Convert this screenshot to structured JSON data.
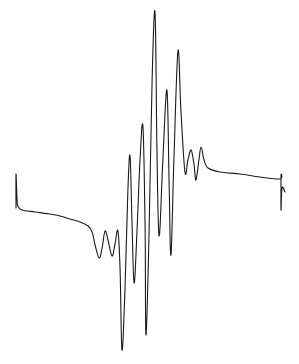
{
  "chart_data": {
    "type": "line",
    "title": "",
    "xlabel": "",
    "ylabel": "",
    "grid": false,
    "legend": "none",
    "xlim": [
      0,
      1000
    ],
    "ylim": [
      -170,
      195
    ],
    "x_units": "arbitrary field position",
    "y_units": "arbitrary intensity",
    "series": [
      {
        "name": "spectrum",
        "color": "#1a1a1a",
        "points": [
          [
            0,
            -13
          ],
          [
            0,
            21
          ],
          [
            4,
            -5
          ],
          [
            7,
            -11
          ],
          [
            22,
            -15
          ],
          [
            71,
            -17
          ],
          [
            126,
            -19
          ],
          [
            164,
            -21
          ],
          [
            201,
            -24
          ],
          [
            238,
            -27
          ],
          [
            268,
            -31
          ],
          [
            283,
            -37
          ],
          [
            294,
            -50
          ],
          [
            309,
            -63
          ],
          [
            320,
            -53
          ],
          [
            331,
            -36
          ],
          [
            342,
            -45
          ],
          [
            357,
            -61
          ],
          [
            368,
            -49
          ],
          [
            379,
            -36
          ],
          [
            387,
            -75
          ],
          [
            394,
            -155
          ],
          [
            405,
            -95
          ],
          [
            416,
            5
          ],
          [
            424,
            39
          ],
          [
            431,
            -25
          ],
          [
            439,
            -88
          ],
          [
            450,
            -35
          ],
          [
            461,
            35
          ],
          [
            472,
            68
          ],
          [
            480,
            -35
          ],
          [
            483,
            -140
          ],
          [
            494,
            -45
          ],
          [
            506,
            115
          ],
          [
            517,
            182
          ],
          [
            524,
            45
          ],
          [
            532,
            -41
          ],
          [
            546,
            35
          ],
          [
            561,
            105
          ],
          [
            569,
            15
          ],
          [
            576,
            -60
          ],
          [
            587,
            35
          ],
          [
            602,
            144
          ],
          [
            613,
            85
          ],
          [
            628,
            23
          ],
          [
            639,
            35
          ],
          [
            651,
            45
          ],
          [
            662,
            30
          ],
          [
            669,
            15
          ],
          [
            680,
            35
          ],
          [
            688,
            48
          ],
          [
            699,
            35
          ],
          [
            714,
            27
          ],
          [
            758,
            23
          ],
          [
            833,
            21
          ],
          [
            907,
            18
          ],
          [
            981,
            16
          ],
          [
            985,
            19
          ],
          [
            985,
            -15
          ],
          [
            989,
            7
          ],
          [
            1000,
            3
          ]
        ]
      }
    ]
  }
}
